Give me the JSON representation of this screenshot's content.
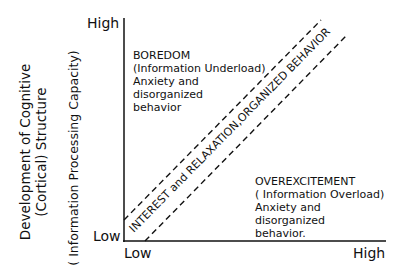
{
  "diagram": {
    "y_axis": {
      "title_line1": "Development of Cognitive",
      "title_line2": "(Cortical) Structure",
      "subtitle": "( Information Processing Capacity)",
      "tick_high": "High",
      "tick_low": "Low"
    },
    "x_axis": {
      "tick_low": "Low",
      "tick_high": "High"
    },
    "regions": {
      "boredom": {
        "title": "BOREDOM",
        "line2": "(Information Underload)",
        "line3": "Anxiety and",
        "line4": "disorganized",
        "line5": "behavior"
      },
      "overexcitement": {
        "title": "OVEREXCITEMENT",
        "line2": "( Information Overload)",
        "line3": "Anxiety and",
        "line4": "disorganized",
        "line5": "behavior."
      },
      "band_label": "INTEREST and RELAXATION,ORGANIZED BEHAVIOR"
    },
    "colors": {
      "ink": "#111111",
      "background": "#ffffff"
    }
  }
}
